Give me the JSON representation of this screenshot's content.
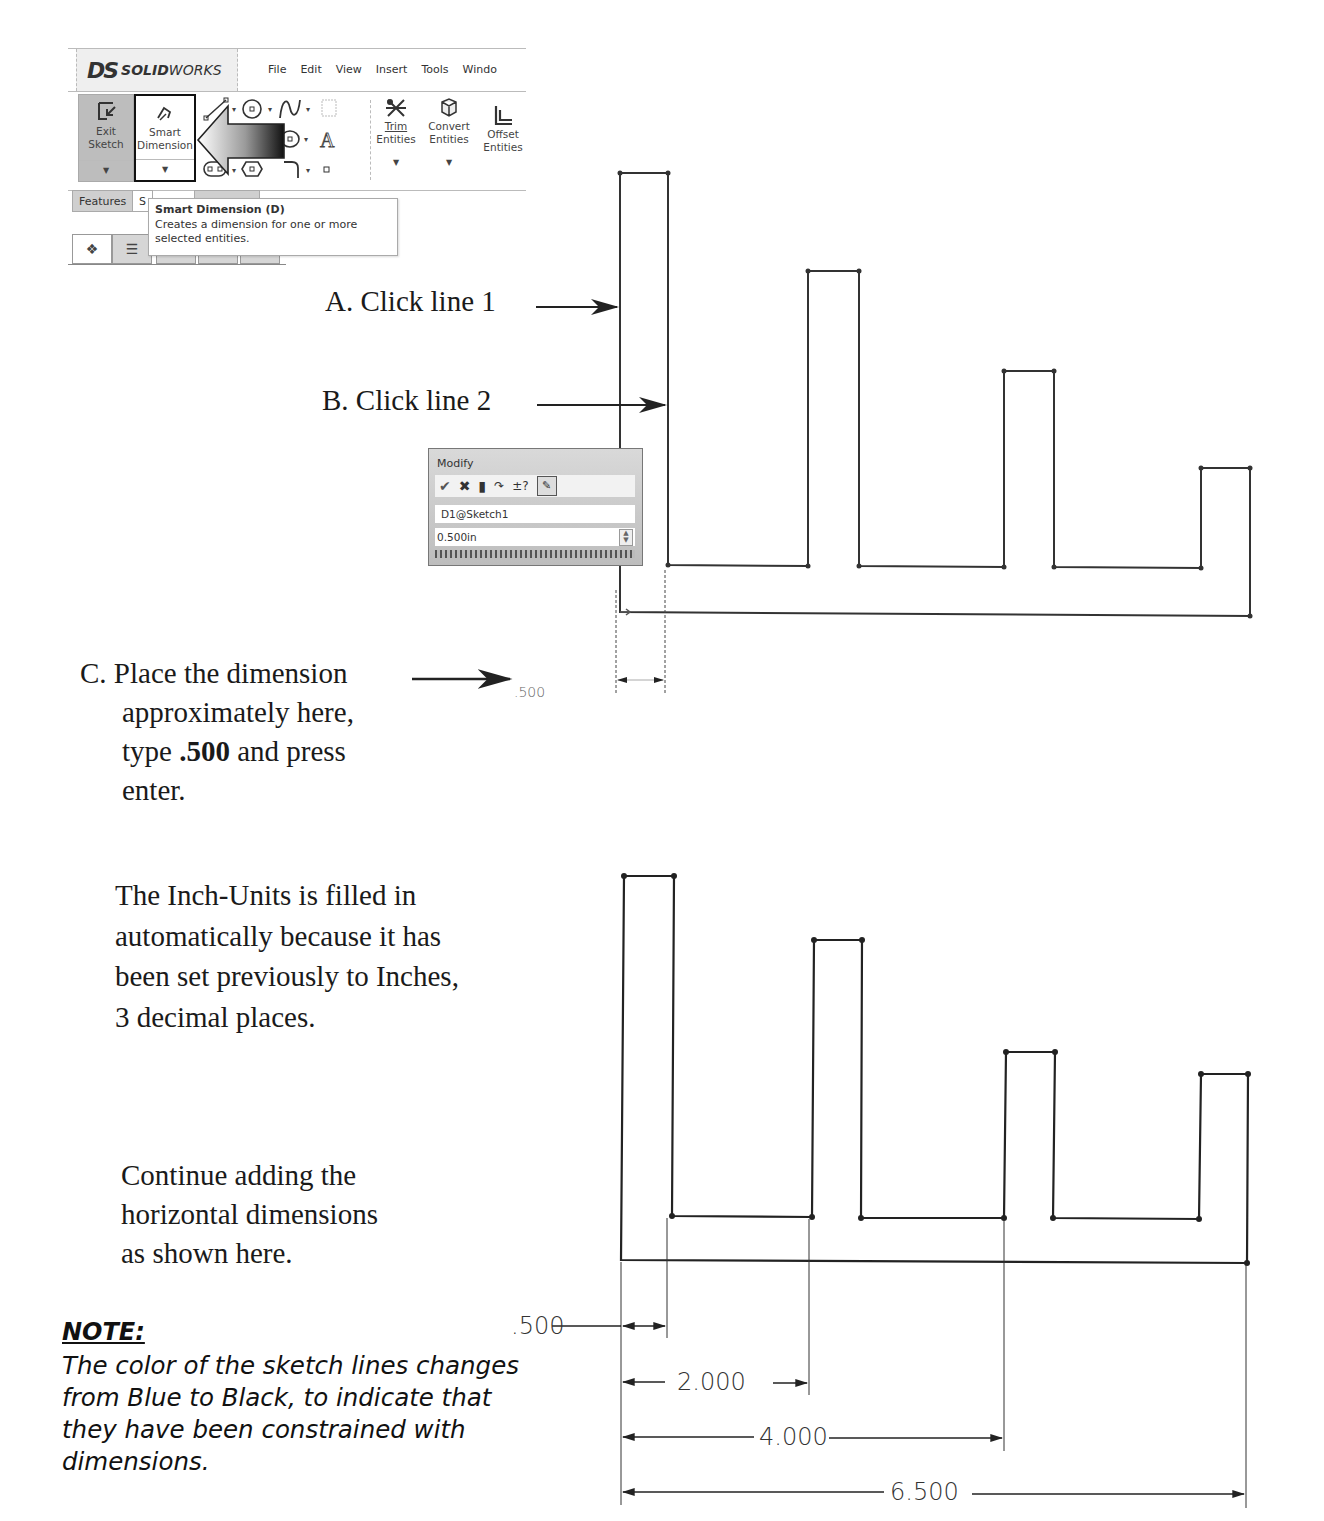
{
  "solidworks_ui": {
    "logo_mark": "DS",
    "brand_bold": "SOLID",
    "brand_light": "WORKS",
    "menu": [
      "File",
      "Edit",
      "View",
      "Insert",
      "Tools",
      "Windo"
    ],
    "ribbon": {
      "exit_sketch": {
        "line1": "Exit",
        "line2": "Sketch",
        "icon": "exit-sketch-icon"
      },
      "smart_dimension": {
        "line1": "Smart",
        "line2": "Dimension",
        "icon": "smart-dimension-icon",
        "highlighted": true
      },
      "sketch_tools": [
        "line-icon",
        "circle-icon",
        "spline-icon",
        "plane-icon",
        "rectangle-icon",
        "ellipse-icon",
        "text-icon",
        "slot-icon",
        "polygon-icon",
        "fillet-icon",
        "point-icon"
      ],
      "trim_entities": {
        "line1": "Trim",
        "line2": "Entities",
        "icon": "trim-icon"
      },
      "convert_entities": {
        "line1": "Convert",
        "line2": "Entities",
        "icon": "convert-icon"
      },
      "offset_entities": {
        "line1": "Offset",
        "line2": "Entities",
        "icon": "offset-icon"
      }
    },
    "tabs": [
      "Features",
      "S"
    ],
    "tooltip": {
      "title": "Smart Dimension   (D)",
      "description_line1": "Creates a dimension for one or more",
      "description_line2": "selected entities."
    },
    "panel_icons": [
      "part-icon",
      "property-manager-icon",
      "config-icon",
      "dimxpert-icon",
      "display-icon"
    ]
  },
  "instructions": {
    "step_a": "A. Click line 1",
    "step_b": "B. Click line 2",
    "step_c_line1": "C. Place the dimension",
    "step_c_line2": "approximately here,",
    "step_c_line3_pre": "type ",
    "step_c_line3_bold": ".500",
    "step_c_line3_post": " and press",
    "step_c_line4": "enter.",
    "units_note": [
      "The Inch-Units is filled in",
      "automatically because it has",
      "been set previously to Inches,",
      "3 decimal places."
    ],
    "continue_note": [
      "Continue adding the",
      "horizontal dimensions",
      "as shown here."
    ]
  },
  "note": {
    "title": "NOTE:",
    "body": "The color of the sketch lines changes from Blue to Black, to indicate that they have been constrained with dimensions."
  },
  "modify_dialog": {
    "title": "Modify",
    "tool_icons": [
      "checkmark-icon",
      "close-icon",
      "regenerate-icon",
      "reverse-icon",
      "tolerance-icon",
      "mark-for-drawing-icon"
    ],
    "dimension_name": "D1@Sketch1",
    "value": "0.500in"
  },
  "sketch_top": {
    "placed_dimension_preview": ".500"
  },
  "sketch_bottom": {
    "dimensions": [
      {
        "label": ".500",
        "value": 0.5
      },
      {
        "label": "2.000",
        "value": 2.0
      },
      {
        "label": "4.000",
        "value": 4.0
      },
      {
        "label": "6.500",
        "value": 6.5
      }
    ]
  }
}
